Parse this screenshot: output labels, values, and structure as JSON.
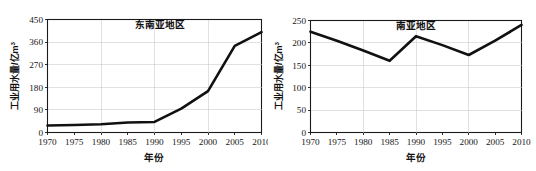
{
  "figure": {
    "panel_count": 2,
    "background_color": "#ffffff",
    "line_color": "#111111",
    "grid_color": "#c9c9c9",
    "axis_color": "#1a1a1a"
  },
  "chart_data": [
    {
      "type": "line",
      "title": "东南亚地区",
      "xlabel": "年份",
      "ylabel": "工业用水量/亿m",
      "ylabel_superscript": "3",
      "x": [
        1970,
        1975,
        1980,
        1985,
        1990,
        1995,
        2000,
        2005,
        2010
      ],
      "categories": [
        "1970",
        "1975",
        "1980",
        "1985",
        "1990",
        "1995",
        "2000",
        "2005",
        "2010"
      ],
      "values": [
        28,
        30,
        33,
        40,
        42,
        95,
        165,
        345,
        400
      ],
      "xtick_labels": [
        "1970",
        "1975",
        "1980",
        "1985",
        "1990",
        "1995",
        "2000",
        "2005",
        "2010"
      ],
      "ytick_labels": [
        "0",
        "90",
        "180",
        "270",
        "360",
        "450"
      ],
      "ytick_values": [
        0,
        90,
        180,
        270,
        360,
        450
      ],
      "xlim": [
        1970,
        2010
      ],
      "ylim": [
        0,
        450
      ],
      "grid": true,
      "legend": "none"
    },
    {
      "type": "line",
      "title": "南亚地区",
      "xlabel": "年份",
      "ylabel": "工业用水量/亿m",
      "ylabel_superscript": "3",
      "x": [
        1970,
        1975,
        1980,
        1985,
        1990,
        1995,
        2000,
        2005,
        2010
      ],
      "categories": [
        "1970",
        "1975",
        "1980",
        "1985",
        "1990",
        "1995",
        "2000",
        "2005",
        "2010"
      ],
      "values": [
        225,
        205,
        183,
        160,
        215,
        195,
        173,
        205,
        240
      ],
      "xtick_labels": [
        "1970",
        "1975",
        "1980",
        "1985",
        "1990",
        "1995",
        "2000",
        "2005",
        "2010"
      ],
      "ytick_labels": [
        "0",
        "50",
        "100",
        "150",
        "200",
        "250"
      ],
      "ytick_values": [
        0,
        50,
        100,
        150,
        200,
        250
      ],
      "xlim": [
        1970,
        2010
      ],
      "ylim": [
        0,
        250
      ],
      "grid": true,
      "legend": "none"
    }
  ]
}
